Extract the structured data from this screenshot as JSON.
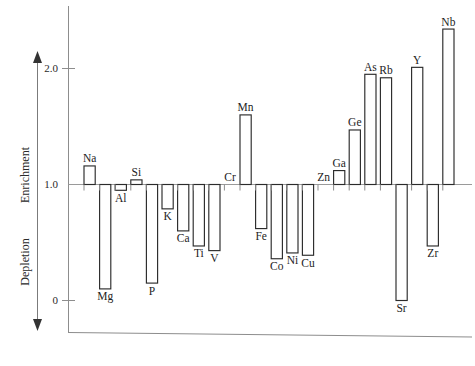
{
  "chart_data": {
    "type": "bar",
    "title": "",
    "subtitle": "",
    "xlabel": "",
    "ylabel": "Enrichment / Depletion",
    "y_axis_upper_label": "Enrichment",
    "y_axis_lower_label": "Depletion",
    "ytick_labels": [
      "0",
      "1.0",
      "2.0"
    ],
    "ytick_values": [
      0,
      1.0,
      2.0
    ],
    "ylim": [
      -0.15,
      2.55
    ],
    "baseline": 1.0,
    "grid": false,
    "legend": null,
    "categories": [
      "Na",
      "Mg",
      "Al",
      "Si",
      "P",
      "K",
      "Ca",
      "Ti",
      "V",
      "Cr",
      "Mn",
      "Fe",
      "Co",
      "Ni",
      "Cu",
      "Zn",
      "Ga",
      "Ge",
      "As",
      "Rb",
      "Sr",
      "Y",
      "Zr",
      "Nb"
    ],
    "values": [
      1.16,
      0.1,
      0.95,
      1.04,
      0.15,
      0.79,
      0.6,
      0.47,
      0.43,
      1.0,
      1.6,
      0.62,
      0.36,
      0.41,
      0.39,
      1.0,
      1.12,
      1.47,
      1.95,
      1.92,
      0.0,
      2.01,
      0.47,
      2.34
    ],
    "bars": [
      {
        "label": "Na",
        "value": 1.16
      },
      {
        "label": "Mg",
        "value": 0.1
      },
      {
        "label": "Al",
        "value": 0.95
      },
      {
        "label": "Si",
        "value": 1.04
      },
      {
        "label": "P",
        "value": 0.15
      },
      {
        "label": "K",
        "value": 0.79
      },
      {
        "label": "Ca",
        "value": 0.6
      },
      {
        "label": "Ti",
        "value": 0.47
      },
      {
        "label": "V",
        "value": 0.43
      },
      {
        "label": "Cr",
        "value": 1.0
      },
      {
        "label": "Mn",
        "value": 1.6
      },
      {
        "label": "Fe",
        "value": 0.62
      },
      {
        "label": "Co",
        "value": 0.36
      },
      {
        "label": "Ni",
        "value": 0.41
      },
      {
        "label": "Cu",
        "value": 0.39
      },
      {
        "label": "Zn",
        "value": 1.0
      },
      {
        "label": "Ga",
        "value": 1.12
      },
      {
        "label": "Ge",
        "value": 1.47
      },
      {
        "label": "As",
        "value": 1.95
      },
      {
        "label": "Rb",
        "value": 1.92
      },
      {
        "label": "Sr",
        "value": 0.0
      },
      {
        "label": "Y",
        "value": 2.01
      },
      {
        "label": "Zr",
        "value": 0.47
      },
      {
        "label": "Nb",
        "value": 2.34
      }
    ]
  }
}
